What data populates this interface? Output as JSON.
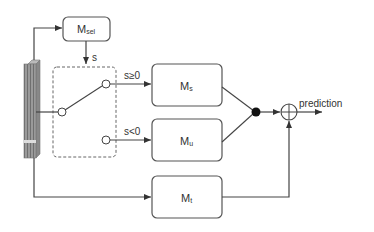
{
  "diagram": {
    "blocks": {
      "msel": {
        "main": "M",
        "sub": "sel"
      },
      "ms": {
        "main": "M",
        "sub": "s"
      },
      "mu": {
        "main": "M",
        "sub": "u"
      },
      "mt": {
        "main": "M",
        "sub": "t"
      }
    },
    "labels": {
      "signal": "s",
      "branch_pos": "s≥0",
      "branch_neg": "s<0",
      "output": "prediction"
    },
    "colors": {
      "stroke": "#555555",
      "input_bar": "#8a8a8a",
      "junction": "#111111"
    }
  }
}
